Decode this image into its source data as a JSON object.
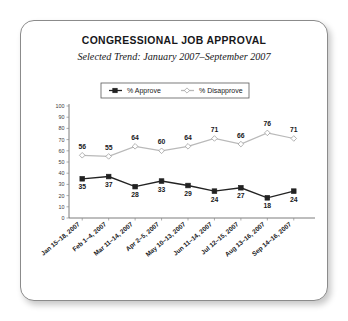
{
  "card": {
    "name": "chart-card"
  },
  "chart_data": {
    "type": "line",
    "title": "CONGRESSIONAL JOB APPROVAL",
    "subtitle": "Selected Trend: January 2007–September 2007",
    "xlabel": "",
    "ylabel": "",
    "ylim": [
      0,
      100
    ],
    "ytick_step": 10,
    "yticks": [
      100,
      90,
      80,
      70,
      60,
      50,
      40,
      30,
      20,
      10,
      0
    ],
    "grid": false,
    "legend_position": "top-center",
    "categories": [
      "Jan 15–18, 2007",
      "Feb 1–4, 2007",
      "Mar 11–14, 2007",
      "Apr 2–5, 2007",
      "May 10–13, 2007",
      "Jun 11–14, 2007",
      "Jul 12–15, 2007",
      "Aug 13–16, 2007",
      "Sep 14–16, 2007"
    ],
    "series": [
      {
        "name": "% Approve",
        "values": [
          35,
          37,
          28,
          33,
          29,
          24,
          27,
          18,
          24
        ],
        "color": "#222222",
        "marker": "square",
        "marker_fill": "#222222",
        "label_position": "below"
      },
      {
        "name": "% Disapprove",
        "values": [
          56,
          55,
          64,
          60,
          64,
          71,
          66,
          76,
          71
        ],
        "color": "#b9b9b9",
        "marker": "diamond",
        "marker_fill": "#ffffff",
        "label_position": "above"
      }
    ]
  },
  "legend": {
    "items": [
      {
        "label": "% Approve",
        "icon": "line-square-marker-icon"
      },
      {
        "label": "% Disapprove",
        "icon": "line-diamond-marker-icon"
      }
    ]
  }
}
